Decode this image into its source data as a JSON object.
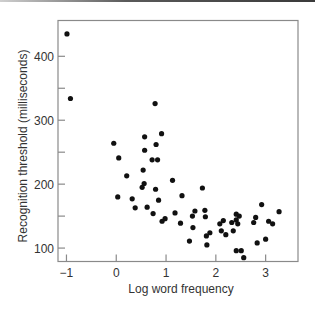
{
  "chart_data": {
    "type": "scatter",
    "title": "",
    "xlabel": "Log word frequency",
    "ylabel": "Recognition threshold (milliseconds)",
    "xlim": [
      -1.17,
      3.65
    ],
    "ylim": [
      79,
      456
    ],
    "x_ticks": [
      -1,
      0,
      1,
      2,
      3
    ],
    "x_tick_labels": [
      "−1",
      "0",
      "1",
      "2",
      "3"
    ],
    "y_ticks": [
      100,
      150,
      200,
      250,
      300,
      350,
      400
    ],
    "y_tick_labels": [
      "100",
      "",
      "200",
      "",
      "300",
      "",
      "400"
    ],
    "grid": false,
    "legend": null,
    "marker_color": "#111111",
    "points": [
      [
        -0.99,
        435
      ],
      [
        -0.92,
        334
      ],
      [
        0.78,
        326
      ],
      [
        0.91,
        279
      ],
      [
        0.57,
        274
      ],
      [
        -0.05,
        264
      ],
      [
        0.8,
        262
      ],
      [
        0.57,
        253
      ],
      [
        0.05,
        241
      ],
      [
        0.72,
        238
      ],
      [
        0.83,
        238
      ],
      [
        0.54,
        222
      ],
      [
        0.21,
        213
      ],
      [
        1.13,
        206
      ],
      [
        0.56,
        201
      ],
      [
        0.52,
        195
      ],
      [
        0.79,
        192
      ],
      [
        1.73,
        194
      ],
      [
        0.03,
        180
      ],
      [
        0.32,
        177
      ],
      [
        0.85,
        175
      ],
      [
        1.32,
        182
      ],
      [
        0.38,
        163
      ],
      [
        0.62,
        164
      ],
      [
        0.74,
        154
      ],
      [
        1.18,
        155
      ],
      [
        0.98,
        146
      ],
      [
        0.92,
        142
      ],
      [
        1.29,
        139
      ],
      [
        1.58,
        158
      ],
      [
        1.78,
        159
      ],
      [
        1.53,
        150
      ],
      [
        1.79,
        149
      ],
      [
        1.54,
        132
      ],
      [
        1.47,
        111
      ],
      [
        1.82,
        105
      ],
      [
        1.88,
        124
      ],
      [
        1.81,
        119
      ],
      [
        2.11,
        127
      ],
      [
        2.2,
        121
      ],
      [
        2.35,
        127
      ],
      [
        2.08,
        138
      ],
      [
        2.15,
        143
      ],
      [
        2.32,
        140
      ],
      [
        2.41,
        153
      ],
      [
        2.47,
        150
      ],
      [
        2.41,
        144
      ],
      [
        2.44,
        138
      ],
      [
        2.41,
        96
      ],
      [
        2.51,
        96
      ],
      [
        2.56,
        85
      ],
      [
        2.92,
        168
      ],
      [
        3.27,
        157
      ],
      [
        2.8,
        148
      ],
      [
        2.76,
        140
      ],
      [
        3.06,
        142
      ],
      [
        3.14,
        138
      ],
      [
        3.0,
        114
      ],
      [
        2.83,
        108
      ]
    ]
  }
}
